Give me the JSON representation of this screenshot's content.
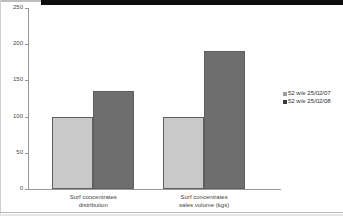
{
  "chart_data": {
    "type": "bar",
    "title": "",
    "subtitle": "",
    "xlabel": "",
    "ylabel": "",
    "ylim": [
      0,
      250
    ],
    "ytick_labels": [
      "0",
      "50",
      "100",
      "150",
      "200",
      "250"
    ],
    "ytick_values": [
      0,
      50,
      100,
      150,
      200,
      250
    ],
    "grid": false,
    "legend_position": "right",
    "categories": [
      "Surf concentrates distribution",
      "Surf concentrates sales volume (kgs)"
    ],
    "category_lines": [
      [
        "Surf concentrates",
        "distribution"
      ],
      [
        "Surf concentrates",
        "sales volume (kgs)"
      ]
    ],
    "series": [
      {
        "name": "52 w/e 25/02/07",
        "color": "#c9c9c9",
        "legend_color": "#9a9a9a",
        "values": [
          100,
          100
        ]
      },
      {
        "name": "52 w/e 25/02/08",
        "color": "#6e6e6e",
        "legend_color": "#3a3a3a",
        "values": [
          135,
          190
        ]
      }
    ]
  },
  "legend": {
    "entries": [
      {
        "label": "52 w/e 25/02/07"
      },
      {
        "label": "52 w/e 25/02/08"
      }
    ]
  },
  "colors": {
    "series_a": "#c9c9c9",
    "series_b": "#6e6e6e",
    "axis": "#9a9a9a",
    "bar_outline": "#5f5f5f",
    "text": "#3a3a3a",
    "scan_band": "#0d0d0d"
  }
}
